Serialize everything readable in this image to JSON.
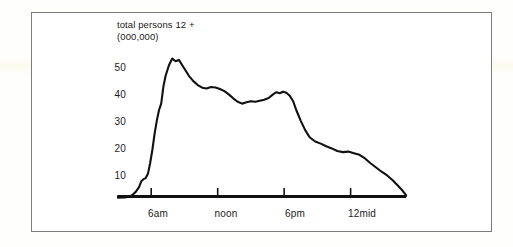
{
  "figure": {
    "title_line1": "total persons 12 +",
    "title_line2": "(000,000)",
    "frame_color": "#7c7c7c",
    "line_color": "#111111",
    "background": "#ffffff"
  },
  "chart_data": {
    "type": "line",
    "title": "total persons 12 +",
    "subtitle": "(000,000)",
    "xlabel": "",
    "ylabel": "total persons 12 + (000,000)",
    "grid": false,
    "legend": null,
    "xlim": [
      3,
      29
    ],
    "ylim": [
      0,
      57
    ],
    "yticks": [
      10,
      20,
      30,
      40,
      50
    ],
    "ytick_labels": [
      "10",
      "20",
      "30",
      "40",
      "50"
    ],
    "xticks": [
      6,
      12,
      18,
      24
    ],
    "xtick_labels": [
      "6am",
      "noon",
      "6pm",
      "12mid"
    ],
    "series": [
      {
        "name": "total persons 12 +",
        "x": [
          3.0,
          3.6,
          4.0,
          4.3,
          4.6,
          4.9,
          5.1,
          5.3,
          5.5,
          5.7,
          5.9,
          6.1,
          6.3,
          6.5,
          6.7,
          6.9,
          7.1,
          7.3,
          7.6,
          7.9,
          8.2,
          8.5,
          8.8,
          9.1,
          9.4,
          9.8,
          10.2,
          10.6,
          11.0,
          11.4,
          11.8,
          12.2,
          12.6,
          13.0,
          13.4,
          13.8,
          14.2,
          14.6,
          15.0,
          15.4,
          15.8,
          16.2,
          16.6,
          17.0,
          17.3,
          17.6,
          17.9,
          18.2,
          18.5,
          18.8,
          19.1,
          19.5,
          19.9,
          20.3,
          20.8,
          21.3,
          21.8,
          22.3,
          22.8,
          23.3,
          23.8,
          24.3,
          24.8,
          25.3,
          25.8,
          26.3,
          26.8,
          27.3,
          27.8,
          28.3,
          28.7,
          29.0
        ],
        "y": [
          2.0,
          2.1,
          2.4,
          3.0,
          4.2,
          6.0,
          8.2,
          9.0,
          9.4,
          11.0,
          15.0,
          20.0,
          26.0,
          31.0,
          35.0,
          37.5,
          44.0,
          48.0,
          52.0,
          54.5,
          53.5,
          54.0,
          52.0,
          50.0,
          48.0,
          46.0,
          44.5,
          43.5,
          43.2,
          43.8,
          43.6,
          43.0,
          42.2,
          41.0,
          39.5,
          38.2,
          37.5,
          38.0,
          38.4,
          38.2,
          38.6,
          39.0,
          39.6,
          41.0,
          41.8,
          41.4,
          42.0,
          41.6,
          40.5,
          38.5,
          35.0,
          31.0,
          27.5,
          24.8,
          23.2,
          22.4,
          21.4,
          20.6,
          19.6,
          19.2,
          19.4,
          18.8,
          18.2,
          16.8,
          15.0,
          13.4,
          11.8,
          10.4,
          8.6,
          6.4,
          4.6,
          3.0
        ],
        "color": "#111111"
      }
    ],
    "annotations": [
      {
        "text": "total persons 12 +",
        "kind": "title-line"
      },
      {
        "text": "(000,000)",
        "kind": "units-line"
      }
    ]
  },
  "axes": {
    "y_labels": [
      "50",
      "40",
      "30",
      "20",
      "10"
    ],
    "x_labels": [
      "6am",
      "noon",
      "6pm",
      "12mid"
    ]
  }
}
